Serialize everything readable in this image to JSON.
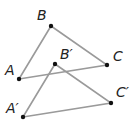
{
  "diagram": {
    "line_color": "#9a9a9a",
    "point_color": "#111111",
    "triangles": [
      {
        "name": "ABC",
        "points": [
          {
            "id": "A",
            "label": "A",
            "x": 19,
            "y": 79,
            "lx": 5,
            "ly": 75
          },
          {
            "id": "B",
            "label": "B",
            "x": 51,
            "y": 26,
            "lx": 37,
            "ly": 20
          },
          {
            "id": "C",
            "label": "C",
            "x": 107,
            "y": 65,
            "lx": 113,
            "ly": 61
          }
        ]
      },
      {
        "name": "A'B'C'",
        "points": [
          {
            "id": "A'",
            "label": "A′",
            "x": 23,
            "y": 117,
            "lx": 6,
            "ly": 113
          },
          {
            "id": "B'",
            "label": "B′",
            "x": 55,
            "y": 64,
            "lx": 60,
            "ly": 59
          },
          {
            "id": "C'",
            "label": "C′",
            "x": 111,
            "y": 103,
            "lx": 116,
            "ly": 97
          }
        ]
      }
    ]
  }
}
